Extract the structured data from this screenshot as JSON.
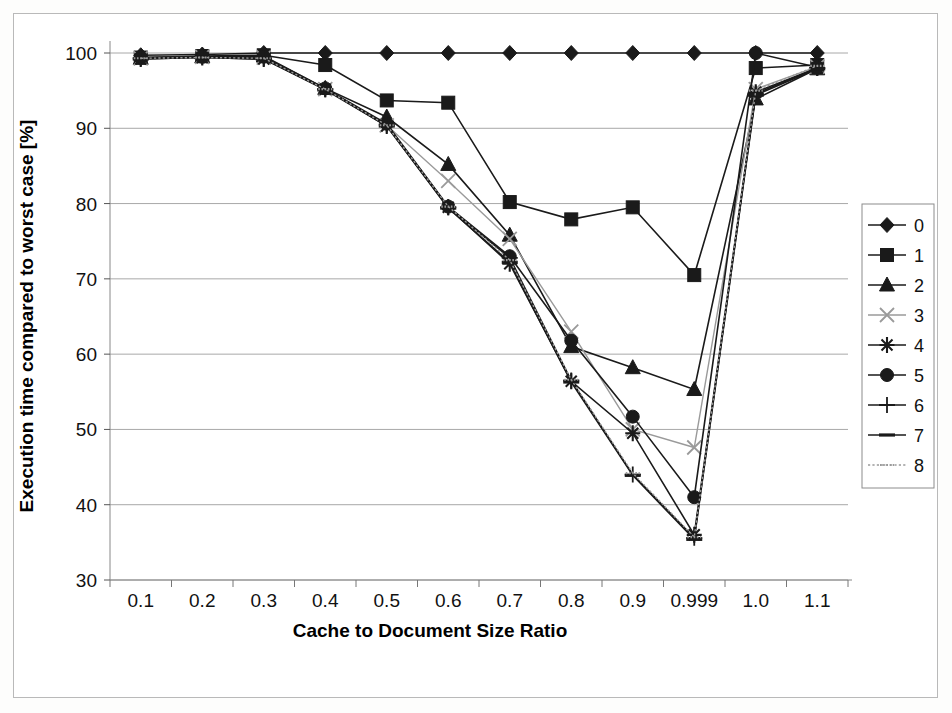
{
  "chart_data": {
    "type": "line",
    "title": "",
    "xlabel": "Cache to Document Size Ratio",
    "ylabel": "Execution time compared to worst case  [%]",
    "categories": [
      "0.1",
      "0.2",
      "0.3",
      "0.4",
      "0.5",
      "0.6",
      "0.7",
      "0.8",
      "0.9",
      "0.999",
      "1.0",
      "1.1"
    ],
    "ylim": [
      30,
      100
    ],
    "yticks": [
      30,
      40,
      50,
      60,
      70,
      80,
      90,
      100
    ],
    "grid": true,
    "legend_position": "right",
    "series": [
      {
        "name": "0",
        "marker": "diamond",
        "values": [
          99.7,
          99.8,
          100.0,
          100.0,
          100.0,
          100.0,
          100.0,
          100.0,
          100.0,
          100.0,
          100.0,
          100.0
        ]
      },
      {
        "name": "1",
        "marker": "square",
        "values": [
          99.4,
          99.6,
          99.7,
          98.4,
          93.7,
          93.4,
          80.2,
          77.9,
          79.5,
          70.5,
          98.0,
          98.4
        ]
      },
      {
        "name": "2",
        "marker": "triangle",
        "values": [
          99.3,
          99.5,
          99.6,
          95.3,
          91.5,
          85.2,
          75.8,
          61.0,
          58.2,
          55.3,
          93.9,
          97.9
        ]
      },
      {
        "name": "3",
        "marker": "x-thin",
        "values": [
          99.3,
          99.5,
          99.4,
          95.2,
          90.4,
          83.0,
          75.3,
          63.0,
          50.0,
          47.6,
          95.2,
          98.2
        ]
      },
      {
        "name": "4",
        "marker": "star",
        "values": [
          99.2,
          99.4,
          99.2,
          95.2,
          90.3,
          79.5,
          72.0,
          56.4,
          49.5,
          36.0,
          94.8,
          98.0
        ]
      },
      {
        "name": "5",
        "marker": "circle",
        "values": [
          99.4,
          99.5,
          99.5,
          95.3,
          90.6,
          79.6,
          73.0,
          61.8,
          51.7,
          41.0,
          100.0,
          98.1
        ]
      },
      {
        "name": "6",
        "marker": "plus",
        "values": [
          99.3,
          99.5,
          99.3,
          95.2,
          90.5,
          79.5,
          72.8,
          56.5,
          44.0,
          35.6,
          94.6,
          98.0
        ]
      },
      {
        "name": "7",
        "marker": "dash",
        "values": [
          99.2,
          99.4,
          99.2,
          95.1,
          90.3,
          79.4,
          72.2,
          56.3,
          43.9,
          35.4,
          94.4,
          97.9
        ]
      },
      {
        "name": "8",
        "marker": "dotted",
        "values": [
          99.3,
          99.4,
          99.3,
          95.2,
          90.4,
          79.6,
          72.5,
          56.6,
          44.2,
          35.7,
          95.0,
          98.3
        ]
      }
    ]
  },
  "legend": {
    "entries": [
      "0",
      "1",
      "2",
      "3",
      "4",
      "5",
      "6",
      "7",
      "8"
    ]
  },
  "axes": {
    "x_tick_labels": [
      "0.1",
      "0.2",
      "0.3",
      "0.4",
      "0.5",
      "0.6",
      "0.7",
      "0.8",
      "0.9",
      "0.999",
      "1.0",
      "1.1"
    ],
    "y_tick_labels": [
      "100",
      "90",
      "80",
      "70",
      "60",
      "50",
      "40",
      "30"
    ],
    "x_axis_title": "Cache to Document Size Ratio",
    "y_axis_title": "Execution time compared to worst case  [%]"
  },
  "colors": {
    "ink": "#1a1a1a",
    "grid": "#a8a8a8",
    "axis": "#888888",
    "light_series": "#9a9a9a",
    "frame": "#b9b9b9",
    "background": "#ffffff"
  }
}
